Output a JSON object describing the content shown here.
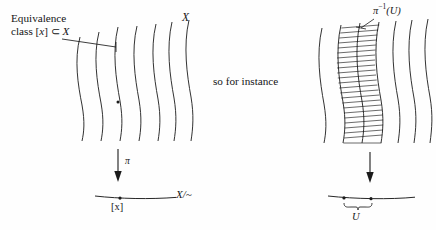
{
  "figure": {
    "width": 436,
    "height": 230,
    "background_color": "#fefefe",
    "ink_color": "#1b1b1b"
  },
  "left_panel": {
    "annotation": {
      "line1": "Equivalence",
      "line2_prefix": "class [",
      "line2_var": "x",
      "line2_mid": "] ⊂ ",
      "line2_space": "X",
      "full_text": "Equivalence class [x] ⊂ X"
    },
    "space_label": "X",
    "fiber_curve_count": 7,
    "highlighted_curve_index": 3,
    "marked_point_label": "[x]",
    "projection_arrow_label": "π",
    "quotient_label": "X/~",
    "quotient_line_point_label": "[x]"
  },
  "middle": {
    "connector_text": "so for instance"
  },
  "right_panel": {
    "preimage_label_pi": "π",
    "preimage_label_exp": "−1",
    "preimage_label_arg": "(U)",
    "preimage_full": "π⁻¹(U)",
    "fiber_curve_count": 7,
    "hatched_region_between_curves": [
      2,
      4
    ],
    "hatch_line_count": 22,
    "projection_arrow_label": "",
    "open_set_label": "U",
    "quotient_line_endpoint_count": 2
  }
}
